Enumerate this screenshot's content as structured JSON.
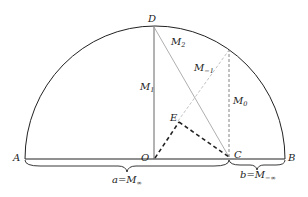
{
  "figure": {
    "points": {
      "A": "A",
      "B": "B",
      "C": "C",
      "D": "D",
      "E": "E",
      "O": "O"
    },
    "segments": {
      "M1": {
        "base": "M",
        "sub": "1"
      },
      "M2": {
        "base": "M",
        "sub": "2"
      },
      "M0": {
        "base": "M",
        "sub": "0"
      },
      "Mm1": {
        "base": "M",
        "sub": "−1"
      }
    },
    "braces": {
      "left": {
        "prefix": "a=",
        "base": "M",
        "sub": "∞"
      },
      "right": {
        "prefix": "b=",
        "base": "M",
        "sub": "−∞"
      }
    },
    "colors": {
      "stroke": "#222222",
      "light_stroke": "#aaaaaa",
      "background": "#ffffff"
    }
  }
}
